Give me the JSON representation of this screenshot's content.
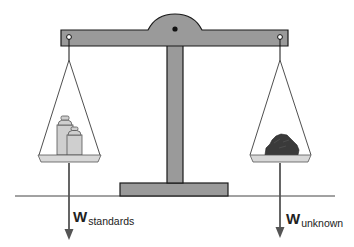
{
  "diagram": {
    "type": "balance-scale",
    "colors": {
      "beam": "#9a9a9a",
      "outline": "#1a1a1a",
      "pan": "#d8d8d8",
      "weights": "#cfcfcf",
      "unknown": "#3a3a3a",
      "arrow": "#555555",
      "ground": "#444444"
    },
    "left": {
      "contents": "standards",
      "force_symbol": "W",
      "force_subscript": "standards"
    },
    "right": {
      "contents": "unknown",
      "force_symbol": "W",
      "force_subscript": "unknown"
    }
  }
}
